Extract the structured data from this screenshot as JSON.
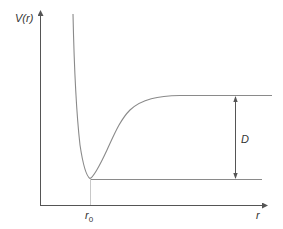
{
  "diagram": {
    "y_axis_label": "V(r)",
    "x_axis_label": "r",
    "equilibrium_label": "r",
    "equilibrium_subscript": "0",
    "depth_label": "D",
    "colors": {
      "axis": "#555555",
      "curve": "#8a8a8a",
      "guide": "#9a9a9a",
      "text": "#333333"
    }
  }
}
